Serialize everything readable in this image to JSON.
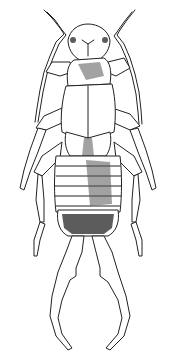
{
  "image": {
    "subject": "earwig illustration",
    "style": "black ink line drawing on white",
    "background": "#ffffff",
    "ink": "#222222"
  }
}
